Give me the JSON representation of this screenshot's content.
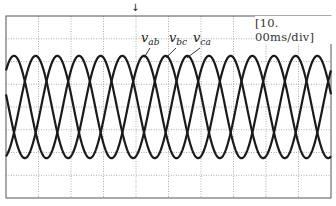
{
  "chart_data": {
    "type": "line",
    "title": "",
    "xlabel": "",
    "ylabel": "",
    "timebase": "[10. 00ms/div]",
    "grid": true,
    "grid_divisions": {
      "x": 10,
      "y": 8
    },
    "legend_position": "inline labels near peaks",
    "series": [
      {
        "name": "v_ab",
        "label_main": "v",
        "label_sub": "ab",
        "phase_deg": 0,
        "amplitude_div": 2.25,
        "offset_div": 0
      },
      {
        "name": "v_bc",
        "label_main": "v",
        "label_sub": "bc",
        "phase_deg": -120,
        "amplitude_div": 2.25,
        "offset_div": 0
      },
      {
        "name": "v_ca",
        "label_main": "v",
        "label_sub": "ca",
        "phase_deg": 120,
        "amplitude_div": 2.25,
        "offset_div": 0
      }
    ],
    "period_div": 2.0,
    "period_ms": 20.0,
    "frequency_hz": 50,
    "xlim_ms": [
      0,
      100
    ],
    "ylim_div": [
      -4,
      4
    ]
  },
  "display": {
    "timebase_label": "[10. 00ms/div]",
    "trigger_marker": "ᾳ",
    "trigger_glyph": "↓"
  },
  "labels": {
    "vab": {
      "main": "v",
      "sub": "ab"
    },
    "vbc": {
      "main": "v",
      "sub": "bc"
    },
    "vca": {
      "main": "v",
      "sub": "ca"
    }
  },
  "colors": {
    "trace": "#1a1a1a",
    "grid": "#9a9a9a",
    "frame": "#555555",
    "background": "#ffffff"
  }
}
